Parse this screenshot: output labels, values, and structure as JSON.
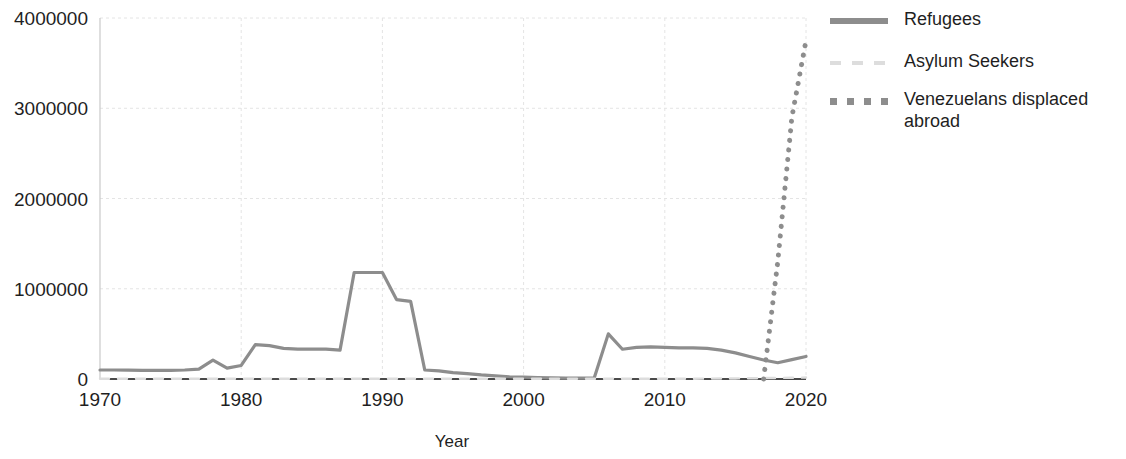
{
  "chart_data": {
    "type": "line",
    "title": "",
    "xlabel": "Year",
    "ylabel": "",
    "xlim": [
      1970,
      2020
    ],
    "ylim": [
      0,
      4000000
    ],
    "grid": true,
    "legend_position": "right",
    "x_ticks": [
      "1970",
      "1980",
      "1990",
      "2000",
      "2010",
      "2020"
    ],
    "x_tick_values": [
      1970,
      1980,
      1990,
      2000,
      2010,
      2020
    ],
    "y_ticks": [
      "0",
      "1000000",
      "2000000",
      "3000000",
      "4000000"
    ],
    "y_tick_values": [
      0,
      1000000,
      2000000,
      3000000,
      4000000
    ],
    "x": [
      1970,
      1971,
      1972,
      1973,
      1974,
      1975,
      1976,
      1977,
      1978,
      1979,
      1980,
      1981,
      1982,
      1983,
      1984,
      1985,
      1986,
      1987,
      1988,
      1989,
      1990,
      1991,
      1992,
      1993,
      1994,
      1995,
      1996,
      1997,
      1998,
      1999,
      2000,
      2001,
      2002,
      2003,
      2004,
      2005,
      2006,
      2007,
      2008,
      2009,
      2010,
      2011,
      2012,
      2013,
      2014,
      2015,
      2016,
      2017,
      2018,
      2019,
      2020
    ],
    "series": [
      {
        "name": "Refugees",
        "style": "solid",
        "color": "#8d8d8d",
        "values": [
          100000,
          100000,
          98000,
          95000,
          95000,
          95000,
          100000,
          110000,
          210000,
          120000,
          150000,
          380000,
          370000,
          340000,
          330000,
          330000,
          330000,
          320000,
          1180000,
          1180000,
          1180000,
          880000,
          860000,
          100000,
          90000,
          70000,
          60000,
          45000,
          35000,
          25000,
          20000,
          15000,
          12000,
          10000,
          10000,
          10000,
          500000,
          330000,
          350000,
          355000,
          350000,
          345000,
          345000,
          340000,
          320000,
          290000,
          250000,
          210000,
          180000,
          215000,
          250000
        ]
      },
      {
        "name": "Asylum Seekers",
        "style": "dashed",
        "color": "#dddddd",
        "values": [
          2000,
          2000,
          2000,
          2000,
          2000,
          2000,
          2000,
          2000,
          2000,
          2000,
          2000,
          2000,
          2000,
          2000,
          2000,
          2000,
          2000,
          2000,
          2000,
          2000,
          2000,
          2000,
          2000,
          2000,
          2000,
          2000,
          2000,
          2000,
          2000,
          2000,
          2000,
          2000,
          2000,
          2000,
          2000,
          2000,
          2000,
          2000,
          2000,
          2000,
          2000,
          3000,
          3000,
          4000,
          5000,
          6000,
          8000,
          10000,
          12000,
          14000,
          16000
        ]
      },
      {
        "name": "Venezuelans displaced abroad",
        "style": "dotted",
        "color": "#8d8d8d",
        "values": [
          null,
          null,
          null,
          null,
          null,
          null,
          null,
          null,
          null,
          null,
          null,
          null,
          null,
          null,
          null,
          null,
          null,
          null,
          null,
          null,
          null,
          null,
          null,
          null,
          null,
          null,
          null,
          null,
          null,
          null,
          null,
          null,
          null,
          null,
          null,
          null,
          null,
          null,
          null,
          null,
          null,
          null,
          null,
          null,
          null,
          null,
          null,
          0,
          1300000,
          2900000,
          3750000
        ]
      }
    ]
  },
  "axis": {
    "x_title": "Year"
  },
  "legend": {
    "items": [
      {
        "label": "Refugees",
        "key": "solid-line-key-icon"
      },
      {
        "label": "Asylum Seekers",
        "key": "dashed-line-key-icon"
      },
      {
        "label": "Venezuelans displaced abroad",
        "key": "dotted-line-key-icon"
      }
    ]
  }
}
